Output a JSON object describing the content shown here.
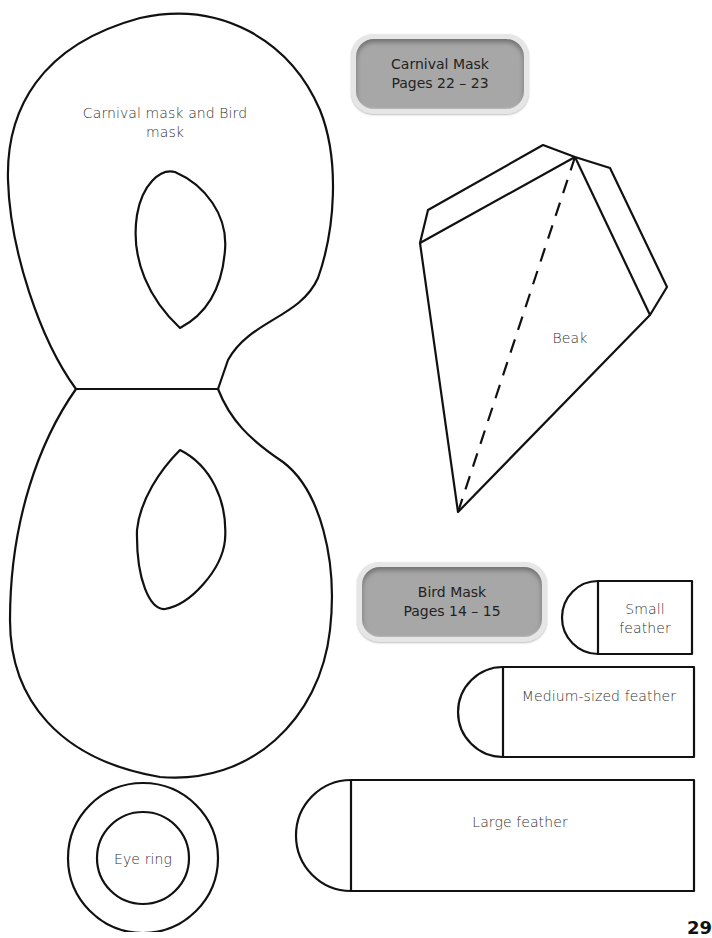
{
  "badges": {
    "carnival": {
      "title": "Carnival Mask",
      "pages": "Pages 22 – 23"
    },
    "bird": {
      "title": "Bird Mask",
      "pages": "Pages 14 – 15"
    }
  },
  "templates": {
    "mask": {
      "label_line1": "Carnival mask and Bird",
      "label_line2": "mask"
    },
    "beak": {
      "label": "Beak"
    },
    "small_feather": {
      "label_line1": "Small",
      "label_line2": "feather"
    },
    "medium_feather": {
      "label": "Medium-sized feather"
    },
    "large_feather": {
      "label": "Large feather"
    },
    "eye_ring": {
      "label": "Eye ring"
    }
  },
  "page_number": "29",
  "colors": {
    "outline": "#111111",
    "badge_fill": "#a7a7a7",
    "badge_rim": "#e6e6e6"
  }
}
